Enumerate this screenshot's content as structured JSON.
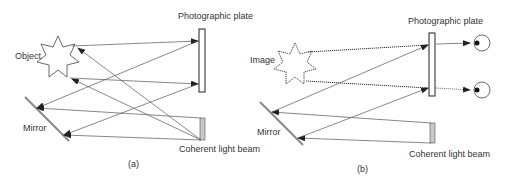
{
  "panel_a": {
    "caption": "(a)",
    "labels": {
      "object": "Object",
      "plate": "Photographic plate",
      "mirror": "Mirror",
      "beam": "Coherent light beam"
    }
  },
  "panel_b": {
    "caption": "(b)",
    "labels": {
      "image": "Image",
      "plate": "Photographic plate",
      "mirror": "Mirror",
      "beam": "Coherent light beam"
    }
  },
  "colors": {
    "line": "#555555",
    "beam_fill": "#c8c8c8",
    "outline": "#222222"
  }
}
